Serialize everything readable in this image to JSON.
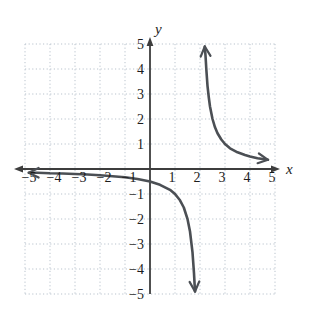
{
  "figure": {
    "background": "#ffffff"
  },
  "chart_data": {
    "type": "line",
    "title": "",
    "subtitle": "",
    "xlabel": "x",
    "ylabel": "y",
    "xlim": [
      -5,
      5
    ],
    "ylim": [
      -5,
      5
    ],
    "grid": true,
    "grid_style": "dotted",
    "legend": "none",
    "x_ticks": [
      -5,
      -4,
      -3,
      -2,
      -1,
      1,
      2,
      3,
      4,
      5
    ],
    "x_tick_labels": [
      "−5",
      "−4",
      "−3",
      "−2",
      "−1",
      "1",
      "2",
      "3",
      "4",
      "5"
    ],
    "y_ticks": [
      5,
      4,
      3,
      2,
      1,
      -1,
      -2,
      -3,
      -4,
      -5
    ],
    "y_tick_labels": [
      "5",
      "4",
      "3",
      "2",
      "1",
      "−1",
      "−2",
      "−3",
      "−4",
      "−5"
    ],
    "asymptotes": {
      "vertical_x": 2,
      "horizontal_y": 0
    },
    "series": [
      {
        "name": "left-branch",
        "arrows": [
          "start-left",
          "end-down"
        ],
        "points": [
          [
            -4.85,
            -0.15
          ],
          [
            -4.5,
            -0.15
          ],
          [
            -4,
            -0.17
          ],
          [
            -3.5,
            -0.18
          ],
          [
            -3,
            -0.2
          ],
          [
            -2.5,
            -0.22
          ],
          [
            -2,
            -0.25
          ],
          [
            -1.5,
            -0.29
          ],
          [
            -1,
            -0.33
          ],
          [
            -0.5,
            -0.4
          ],
          [
            0,
            -0.5
          ],
          [
            0.4,
            -0.63
          ],
          [
            0.8,
            -0.83
          ],
          [
            1,
            -1
          ],
          [
            1.2,
            -1.25
          ],
          [
            1.35,
            -1.54
          ],
          [
            1.5,
            -2
          ],
          [
            1.6,
            -2.5
          ],
          [
            1.7,
            -3.33
          ],
          [
            1.76,
            -4.17
          ],
          [
            1.8,
            -4.9
          ]
        ]
      },
      {
        "name": "right-branch",
        "arrows": [
          "start-up",
          "end-right"
        ],
        "points": [
          [
            2.19,
            4.9
          ],
          [
            2.22,
            4.55
          ],
          [
            2.25,
            4
          ],
          [
            2.3,
            3.33
          ],
          [
            2.35,
            2.86
          ],
          [
            2.4,
            2.5
          ],
          [
            2.5,
            2
          ],
          [
            2.6,
            1.67
          ],
          [
            2.7,
            1.43
          ],
          [
            2.85,
            1.18
          ],
          [
            3,
            1
          ],
          [
            3.2,
            0.83
          ],
          [
            3.5,
            0.67
          ],
          [
            3.8,
            0.56
          ],
          [
            4,
            0.5
          ],
          [
            4.3,
            0.43
          ],
          [
            4.72,
            0.37
          ]
        ]
      }
    ],
    "colors": {
      "curve": "#4b4f54",
      "axis": "#3d3d3d",
      "grid": "#b9c3cd",
      "text": "#1c1c1c"
    }
  }
}
